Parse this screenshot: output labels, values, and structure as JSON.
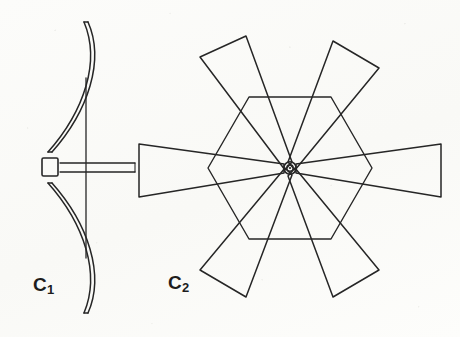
{
  "figure": {
    "background_color": "#fdfdfc",
    "ink_color": "#262626",
    "width": 460,
    "height": 337,
    "panels": [
      {
        "id": "c1",
        "label": "C",
        "subscript": "1",
        "name": "recurve-bow",
        "description": "Side view of a recurve bow with a nocked arrow on the string",
        "parts": [
          "upper-limb",
          "lower-limb",
          "bowstring",
          "grip-nock-block",
          "arrow-shaft"
        ]
      },
      {
        "id": "c2",
        "label": "C",
        "subscript": "2",
        "name": "six-blade-windmill-rotor",
        "description": "Front view of a six-bladed windmill rotor with hexagonal frame and central hub",
        "blade_count": 6,
        "blade_angles_deg": [
          0,
          60,
          120,
          180,
          240,
          300
        ],
        "hub": {
          "name": "center-hub",
          "center_x": 290,
          "center_y": 168,
          "outer_radius": 6,
          "inner_radius": 3
        },
        "frame": {
          "name": "hexagonal-frame",
          "sides": 6,
          "circumradius": 82
        }
      }
    ]
  }
}
